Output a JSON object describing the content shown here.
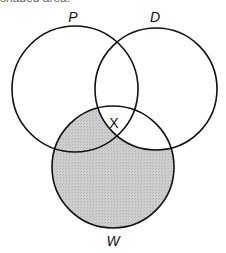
{
  "caption_fragment": "shaded area.",
  "diagram": {
    "type": "venn",
    "circles": [
      {
        "label": "P",
        "cx": 75,
        "cy": 89,
        "r": 63,
        "label_x": 73,
        "label_y": 22
      },
      {
        "label": "D",
        "cx": 156,
        "cy": 89,
        "r": 61,
        "label_x": 155,
        "label_y": 22
      },
      {
        "label": "W",
        "cx": 113,
        "cy": 167,
        "r": 61,
        "label_x": 113,
        "label_y": 246
      }
    ],
    "marker": {
      "label": "X",
      "x": 114,
      "y": 128,
      "region": "P∩D∩W"
    },
    "shaded_region": "W minus D",
    "shade_color": "#c4c4c4",
    "stroke_color": "#111111"
  }
}
